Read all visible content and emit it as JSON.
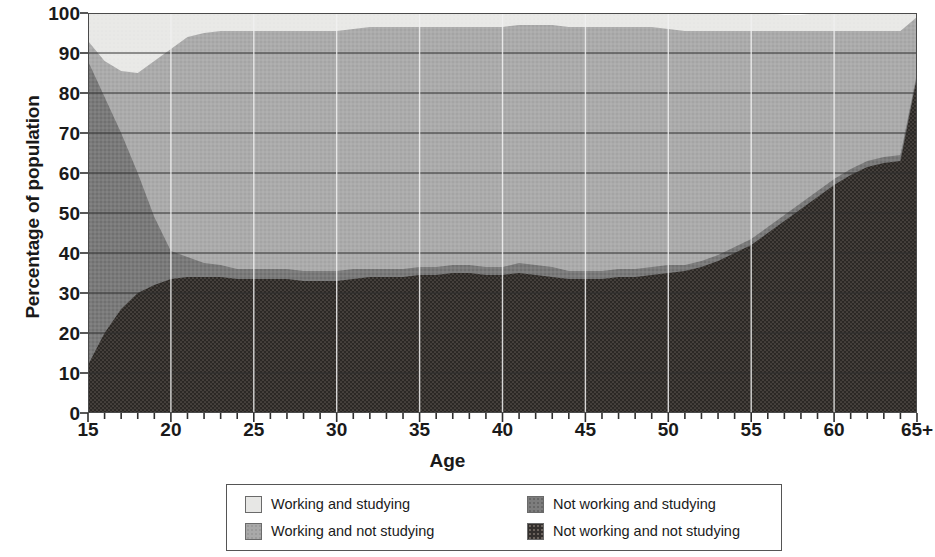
{
  "chart_data": {
    "type": "area",
    "title": "",
    "subtitle": "",
    "xlabel": "Age",
    "ylabel": "Percentage of population",
    "stacked": true,
    "stack_order": "bottom-to-top",
    "grid": true,
    "grid_axis": "y",
    "legend_position": "bottom",
    "xlim": [
      15,
      65
    ],
    "ylim": [
      0,
      100
    ],
    "ytick_values": [
      0,
      10,
      20,
      30,
      40,
      50,
      60,
      70,
      80,
      90,
      100
    ],
    "ytick_labels": [
      "0",
      "10",
      "20",
      "30",
      "40",
      "50",
      "60",
      "70",
      "80",
      "90",
      "100"
    ],
    "xtick_values": [
      15,
      20,
      25,
      30,
      35,
      40,
      45,
      50,
      55,
      60,
      65
    ],
    "xtick_labels": [
      "15",
      "20",
      "25",
      "30",
      "35",
      "40",
      "45",
      "50",
      "55",
      "60",
      "65+"
    ],
    "x_minor_tick_step": 1,
    "x": [
      15,
      16,
      17,
      18,
      19,
      20,
      21,
      22,
      23,
      24,
      25,
      26,
      27,
      28,
      29,
      30,
      31,
      32,
      33,
      34,
      35,
      36,
      37,
      38,
      39,
      40,
      41,
      42,
      43,
      44,
      45,
      46,
      47,
      48,
      49,
      50,
      51,
      52,
      53,
      54,
      55,
      56,
      57,
      58,
      59,
      60,
      61,
      62,
      63,
      64,
      65
    ],
    "series": [
      {
        "name": "Not working and not studying",
        "color": "#332f2d",
        "pattern": "dense-dot",
        "values": [
          12,
          20,
          26,
          30,
          32,
          33.5,
          34,
          34,
          34,
          33.5,
          33.5,
          33.5,
          33.5,
          33,
          33,
          33,
          33.5,
          34,
          34,
          34,
          34.5,
          34.5,
          35,
          35,
          34.5,
          34.5,
          35,
          34.5,
          34,
          33.5,
          33.5,
          33.5,
          34,
          34,
          34.5,
          35,
          35.5,
          36.5,
          38,
          40,
          42,
          45,
          48,
          51,
          54,
          57,
          59.5,
          61.5,
          62.5,
          63,
          84
        ]
      },
      {
        "name": "Not working and studying",
        "color": "#7d7d7d",
        "pattern": "dot",
        "values": [
          76,
          59,
          44,
          30,
          17,
          7,
          5,
          3.5,
          3,
          2.5,
          2.5,
          2.5,
          2.5,
          2.5,
          2.5,
          2.5,
          2.5,
          2,
          2,
          2,
          2,
          2,
          2,
          2,
          2,
          2,
          2.5,
          2.5,
          2.5,
          2,
          2,
          2,
          2,
          2,
          2,
          2,
          1.5,
          1.5,
          1.5,
          1.5,
          1.5,
          1.5,
          1.5,
          1.5,
          1.5,
          1.5,
          1.5,
          1.5,
          1.5,
          1.5,
          1
        ]
      },
      {
        "name": "Working and not studying",
        "color": "#a9a9a9",
        "pattern": "fine-dot",
        "values": [
          5,
          9,
          15.5,
          25,
          39,
          50.5,
          55,
          57.5,
          58.5,
          59.5,
          59.5,
          59.5,
          59.5,
          60,
          60,
          60,
          60,
          60.5,
          60.5,
          60.5,
          60,
          60,
          59.5,
          59.5,
          60,
          60,
          59.5,
          60,
          60.5,
          61,
          61,
          61,
          60.5,
          60.5,
          60,
          59,
          58.5,
          57.5,
          56,
          54,
          52,
          49,
          46,
          43,
          40,
          37,
          34.5,
          32.5,
          31.5,
          31,
          14
        ]
      },
      {
        "name": "Working and studying",
        "color": "#e7e7e5",
        "pattern": "none",
        "values": [
          7,
          12,
          14.5,
          15,
          12,
          9,
          6,
          5,
          4.5,
          4.5,
          4.5,
          4.5,
          4.5,
          4.5,
          4.5,
          4.5,
          4,
          3.5,
          3.5,
          3.5,
          3.5,
          3.5,
          3.5,
          3.5,
          3.5,
          3.5,
          3,
          3,
          3,
          3.5,
          3.5,
          3.5,
          3.5,
          3.5,
          3.5,
          4,
          4.5,
          4.5,
          4.5,
          4.5,
          4.5,
          4.5,
          4,
          4,
          4.5,
          4.5,
          4.5,
          4.5,
          4.5,
          4.5,
          1
        ]
      }
    ],
    "legend_entries": [
      {
        "label": "Working and studying",
        "color": "#e7e7e5"
      },
      {
        "label": "Working and not studying",
        "color": "#a9a9a9"
      },
      {
        "label": "Not working and studying",
        "color": "#7d7d7d"
      },
      {
        "label": "Not working and not studying",
        "color": "#332f2d"
      }
    ]
  }
}
